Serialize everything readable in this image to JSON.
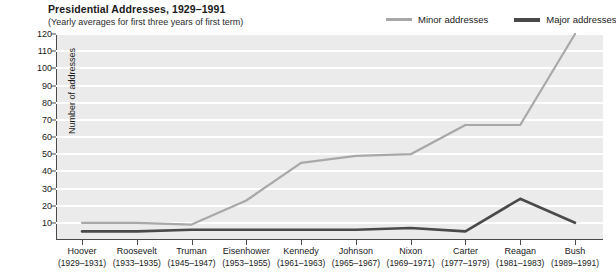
{
  "header": {
    "title": "Presidential Addresses, 1929–1991",
    "subtitle": "(Yearly averages for first three years of first term)"
  },
  "legend": {
    "position": "top-right",
    "items": [
      {
        "label": "Minor addresses",
        "color": "#a8a8a8"
      },
      {
        "label": "Major addresses",
        "color": "#4a4a4a"
      }
    ]
  },
  "chart_data": {
    "type": "line",
    "title": "Presidential Addresses, 1929–1991",
    "subtitle": "(Yearly averages for first three years of first term)",
    "xlabel": "",
    "ylabel": "Number of addresses",
    "ylim": [
      0,
      120
    ],
    "yticks": [
      10,
      20,
      30,
      40,
      50,
      60,
      70,
      80,
      90,
      100,
      110,
      120
    ],
    "grid": true,
    "categories": [
      "Hoover",
      "Roosevelt",
      "Truman",
      "Eisenhower",
      "Kennedy",
      "Johnson",
      "Nixon",
      "Carter",
      "Reagan",
      "Bush"
    ],
    "category_years": [
      "(1929–1931)",
      "(1933–1935)",
      "(1945–1947)",
      "(1953–1955)",
      "(1961–1963)",
      "(1965–1967)",
      "(1969–1971)",
      "(1977–1979)",
      "(1981–1983)",
      "(1989–1991)"
    ],
    "series": [
      {
        "name": "Minor addresses",
        "color": "#a8a8a8",
        "values": [
          10,
          10,
          9,
          23,
          45,
          49,
          50,
          67,
          67,
          120
        ]
      },
      {
        "name": "Major addresses",
        "color": "#4a4a4a",
        "values": [
          5,
          5,
          6,
          6,
          6,
          6,
          7,
          5,
          24,
          10
        ]
      }
    ]
  }
}
